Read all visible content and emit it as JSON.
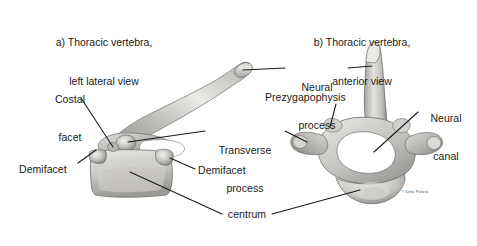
{
  "figure": {
    "background_color": "#ffffff",
    "ink_color": "#1a1a1a",
    "bone_light": "#f2f1ef",
    "bone_mid": "#c9c7c4",
    "bone_dark": "#8e8c89",
    "bone_shadow": "#6e6c6a",
    "credit": "© Dino Pulerà"
  },
  "panels": {
    "a": {
      "line1": "a) Thoracic vertebra,",
      "line2": "left lateral view"
    },
    "b": {
      "line1": "b) Thoracic vertebra,",
      "line2": "anterior view"
    }
  },
  "labels": {
    "costal_facet": {
      "line1": "Costal",
      "line2": "facet"
    },
    "demifacet_left": "Demifacet",
    "demifacet_right": "Demifacet",
    "transverse_process": {
      "line1": "Transverse",
      "line2": "process"
    },
    "neural_process": {
      "line1": "Neural",
      "line2": "process"
    },
    "prezygapophysis": "Prezygapophysis",
    "neural_canal": {
      "line1": "Neural",
      "line2": "canal"
    },
    "centrum": "centrum"
  }
}
